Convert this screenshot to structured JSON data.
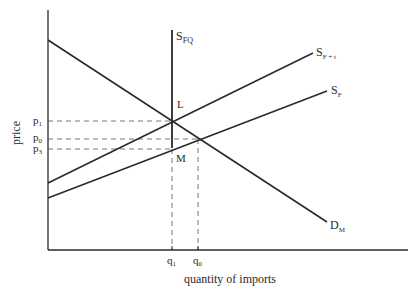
{
  "diagram": {
    "axes": {
      "y_label": "price",
      "x_label": "quantity of imports"
    },
    "curves": {
      "quota_supply": {
        "base": "S",
        "sub": "FQ"
      },
      "tariff_supply": {
        "base": "S",
        "sub": "F + t"
      },
      "foreign_supply": {
        "base": "S",
        "sub": "F"
      },
      "import_demand": {
        "base": "D",
        "sub": "M"
      }
    },
    "points": {
      "L": "L",
      "M": "M"
    },
    "price_ticks": [
      {
        "base": "p",
        "sub": "1"
      },
      {
        "base": "p",
        "sub": "0"
      },
      {
        "base": "p",
        "sub": "3"
      }
    ],
    "quantity_ticks": [
      {
        "base": "q",
        "sub": "1"
      },
      {
        "base": "q",
        "sub": "0"
      }
    ],
    "colors": {
      "line": "#2a2a2a",
      "dashed": "#555555"
    }
  }
}
